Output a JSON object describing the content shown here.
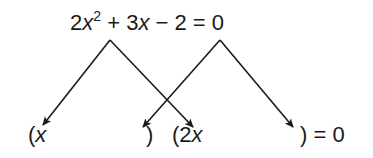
{
  "equation": {
    "coef_a": "2",
    "var": "x",
    "exp": "2",
    "op1": " + ",
    "coef_b": "3",
    "op2": " − ",
    "const": "2",
    "rhs": " = 0"
  },
  "factored": {
    "open1": "(",
    "term1_var": "x",
    "close1": ")",
    "open2": "(",
    "term2_coef": "2",
    "term2_var": "x",
    "close2_rhs": ") = 0"
  },
  "colors": {
    "ink": "#1a1a1a",
    "background": "#ffffff"
  },
  "arrows": [
    {
      "from": "2x^2",
      "to": "x",
      "apex": [
        110,
        40
      ],
      "tip": [
        43,
        125
      ]
    },
    {
      "from": "2x^2",
      "to": "2x",
      "apex": [
        110,
        40
      ],
      "tip": [
        193,
        127
      ]
    },
    {
      "from": "-2",
      "to": "close1",
      "apex": [
        220,
        40
      ],
      "tip": [
        143,
        127
      ]
    },
    {
      "from": "-2",
      "to": "close2",
      "apex": [
        220,
        40
      ],
      "tip": [
        293,
        127
      ]
    }
  ]
}
